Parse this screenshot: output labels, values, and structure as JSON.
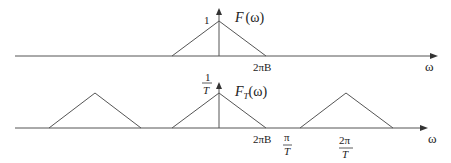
{
  "diagram": {
    "line_color": "#555555",
    "text_color": "#222222",
    "top_plot": {
      "title": "F(ω)",
      "title_func": "F",
      "title_arg": "(ω)",
      "peak_label": "1",
      "right_edge_label": "2πB",
      "axis_label": "ω"
    },
    "bottom_plot": {
      "title_func": "F",
      "title_sub": "T",
      "title_arg": "(ω)",
      "peak_label_num": "1",
      "peak_label_den": "T",
      "right_edge_label": "2πB",
      "half_sample_num": "π",
      "half_sample_den": "T",
      "sample_num": "2π",
      "sample_den": "T",
      "axis_label": "ω"
    }
  }
}
